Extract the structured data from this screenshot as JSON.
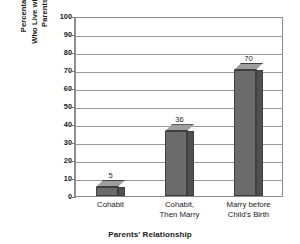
{
  "chart_data": {
    "type": "bar",
    "title": "",
    "categories": [
      "Cohabit",
      "Cohabit, Then Marry",
      "Marry before Child's Birth"
    ],
    "category_lines": [
      [
        "Cohabit"
      ],
      [
        "Cohabit,",
        "Then Marry"
      ],
      [
        "Marry before",
        "Child's Birth"
      ]
    ],
    "values": [
      5,
      36,
      70
    ],
    "value_labels": [
      "5",
      "36",
      "70"
    ],
    "xlabel": "Parents' Relationship",
    "ylabel": "Percentage of Children Who Live with Two Biological Parents until Age 18",
    "ylabel_lines": [
      "Percentage of Children",
      "Who Live with Two Biological",
      "Parents until Age 18"
    ],
    "ylim": [
      0,
      100
    ],
    "ytick_step": 10,
    "yticks": [
      0,
      10,
      20,
      30,
      40,
      50,
      60,
      70,
      80,
      90,
      100
    ],
    "ytick_labels": [
      "0",
      "10",
      "20",
      "30",
      "40",
      "50",
      "60",
      "70",
      "80",
      "90",
      "100"
    ],
    "grid": true,
    "grid_axis": "y",
    "legend": false,
    "legend_position": "none",
    "style": "3d-bars",
    "colors": {
      "bar_front": "#6b6b6b",
      "bar_top": "#9e9e9e",
      "bar_side": "#4f4f4f",
      "bar_outline": "#3f3f3f",
      "gridline": "#9a9a9a",
      "axis": "#8a8a8a",
      "text": "#1a1a1a",
      "background": "#ffffff"
    }
  }
}
